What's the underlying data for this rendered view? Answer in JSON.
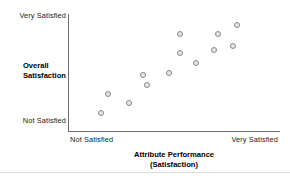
{
  "chart_data": {
    "type": "scatter",
    "title": "",
    "xlabel": "Attribute Performance (Satisfaction)",
    "ylabel": "Overall Satisfaction",
    "xlabel_line1": "Attribute Performance",
    "xlabel_line2": "(Satisfaction)",
    "ylabel_line1": "Overall",
    "ylabel_line2": "Satisfaction",
    "x_tick_labels": [
      "Not Satisfied",
      "Very Satisfied"
    ],
    "y_tick_labels": [
      "Not Satisfied",
      "Very Satisfied"
    ],
    "x_axis_low_label": "Not Satisfied",
    "x_axis_high_label": "Very Satisfied",
    "y_axis_low_label": "Not Satisfied",
    "y_axis_high_label": "Very Satisfied",
    "xlim": [
      0,
      100
    ],
    "ylim": [
      0,
      100
    ],
    "grid": false,
    "legend": false,
    "marker": "open-circle",
    "marker_fill": "#e4e4e4",
    "marker_stroke": "#8a8a8a",
    "axis_color": "#6f6f6f",
    "n_points": 13,
    "points": [
      {
        "x": 15.1,
        "y": 15.4
      },
      {
        "x": 18.4,
        "y": 31.6
      },
      {
        "x": 28.3,
        "y": 24.4
      },
      {
        "x": 35.0,
        "y": 48.7
      },
      {
        "x": 36.9,
        "y": 39.3
      },
      {
        "x": 47.6,
        "y": 50.4
      },
      {
        "x": 52.4,
        "y": 83.8
      },
      {
        "x": 52.4,
        "y": 67.5
      },
      {
        "x": 60.4,
        "y": 59.0
      },
      {
        "x": 68.9,
        "y": 70.1
      },
      {
        "x": 70.8,
        "y": 83.8
      },
      {
        "x": 77.8,
        "y": 73.5
      },
      {
        "x": 79.7,
        "y": 91.5
      }
    ]
  }
}
